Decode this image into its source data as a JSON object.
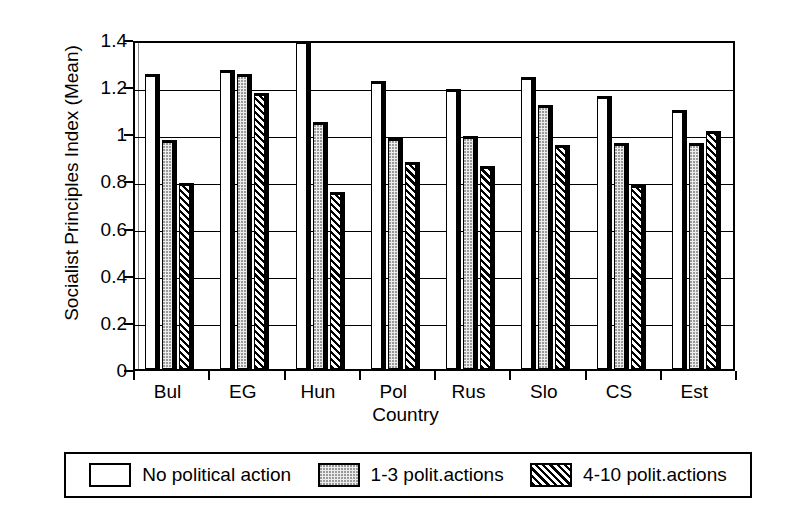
{
  "chart_data": {
    "type": "bar",
    "title": "",
    "xlabel": "Country",
    "ylabel": "Socialist Principles Index (Mean)",
    "categories": [
      "Bul",
      "EG",
      "Hun",
      "Pol",
      "Rus",
      "Slo",
      "CS",
      "Est"
    ],
    "series": [
      {
        "name": "No political action",
        "pattern": "solid-white",
        "values": [
          1.25,
          1.27,
          1.39,
          1.22,
          1.19,
          1.24,
          1.16,
          1.1
        ]
      },
      {
        "name": "1-3 polit.actions",
        "pattern": "dotted-light",
        "values": [
          0.97,
          1.25,
          1.05,
          0.98,
          0.99,
          1.12,
          0.96,
          0.96
        ]
      },
      {
        "name": "4-10 polit.actions",
        "pattern": "diagonal-hatch",
        "values": [
          0.79,
          1.17,
          0.75,
          0.88,
          0.86,
          0.95,
          0.78,
          1.01
        ]
      }
    ],
    "ylim": [
      0,
      1.4
    ],
    "yticks": [
      0,
      0.2,
      0.4,
      0.6,
      0.8,
      1.0,
      1.2,
      1.4
    ],
    "ytick_labels": [
      "0",
      "0.2",
      "0.4",
      "0.6",
      "0.8",
      "1",
      "1.2",
      "1.4"
    ],
    "grid": true,
    "legend_position": "bottom"
  },
  "colors": {
    "axis": "#000000",
    "grid": "#000000",
    "series0": "#ffffff",
    "series1": "#ececec",
    "series2": "#000000",
    "background": "#ffffff"
  }
}
